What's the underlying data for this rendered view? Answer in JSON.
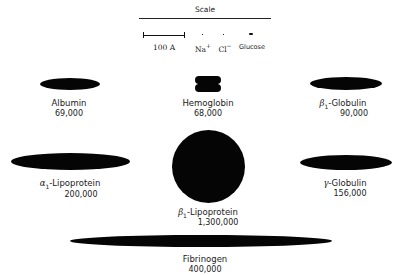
{
  "scale": {
    "title": "Scale",
    "bar_label": "100 A",
    "ions": [
      {
        "label": "Na",
        "sup": "+"
      },
      {
        "label": "Cl",
        "sup": "−"
      },
      {
        "label": "Glucose",
        "sup": ""
      }
    ]
  },
  "proteins": [
    {
      "id": "albumin",
      "prefix": "",
      "sub": "",
      "name": "Albumin",
      "mw": "69,000",
      "shape": "ellipse"
    },
    {
      "id": "hemoglobin",
      "prefix": "",
      "sub": "",
      "name": "Hemoglobin",
      "mw": "68,000",
      "shape": "tetramer"
    },
    {
      "id": "beta1-globulin",
      "prefix": "β",
      "sub": "1",
      "name": "-Globulin",
      "mw": "90,000",
      "shape": "ellipse"
    },
    {
      "id": "alpha1-lipoprotein",
      "prefix": "α",
      "sub": "1",
      "name": "-Lipoprotein",
      "mw": "200,000",
      "shape": "ellipse"
    },
    {
      "id": "beta1-lipoprotein",
      "prefix": "β",
      "sub": "1",
      "name": "-Lipoprotein",
      "mw": "1,300,000",
      "shape": "sphere"
    },
    {
      "id": "gamma-globulin",
      "prefix": "γ",
      "sub": "",
      "name": "-Globulin",
      "mw": "156,000",
      "shape": "ellipse"
    },
    {
      "id": "fibrinogen",
      "prefix": "",
      "sub": "",
      "name": "Fibrinogen",
      "mw": "400,000",
      "shape": "rod"
    }
  ]
}
